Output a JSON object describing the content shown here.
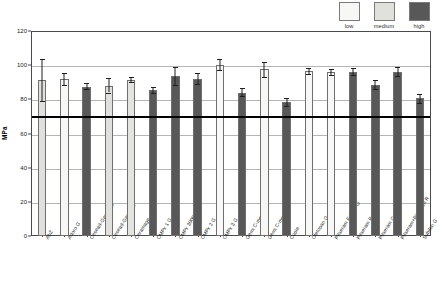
{
  "chart_data": {
    "type": "bar",
    "title": "",
    "xlabel": "",
    "ylabel": "MPa",
    "ylim": [
      0,
      120
    ],
    "ytick_values": [
      0,
      20,
      40,
      60,
      80,
      100,
      120
    ],
    "ytick_labels": [
      "0",
      "20",
      "40",
      "60",
      "80",
      "100",
      "120"
    ],
    "grid": true,
    "legend_position": "top-right",
    "reference_line": {
      "value": 70,
      "label": "",
      "style": "solid-bold"
    },
    "legend": [
      {
        "name": "low",
        "color": "#f7f7f5"
      },
      {
        "name": "medium",
        "color": "#e0e0dd"
      },
      {
        "name": "high",
        "color": "#585858"
      }
    ],
    "categories": [
      "AbZ",
      "Adoro G",
      "Cesead-Gama HV",
      "Cesead-Gama LV",
      "Ceramage",
      "CMPx 1 G",
      "CMPx 3000 G",
      "CMPx 2 G",
      "CMPx 3 G",
      "Gemi C-mente 1",
      "Gemi C-mente 3",
      "Cupie",
      "Oletopan G",
      "Pitseram E Flow G",
      "Pitseram R G",
      "Pitseram G",
      "Pitseram+Pitseram R",
      "Subilon G"
    ],
    "values": [
      91.5,
      92.0,
      87.5,
      88.0,
      91.5,
      85.5,
      93.5,
      92.0,
      100.0,
      84.0,
      97.5,
      78.5,
      96.5,
      96.0,
      96.0,
      88.5,
      96.0,
      80.5
    ],
    "errors_upper": [
      12.0,
      3.5,
      2.0,
      4.5,
      1.5,
      2.0,
      5.5,
      3.5,
      3.5,
      2.5,
      4.5,
      2.5,
      2.0,
      2.0,
      2.5,
      3.0,
      3.0,
      2.5
    ],
    "errors_lower": [
      12.5,
      3.5,
      1.5,
      4.0,
      1.5,
      2.0,
      5.0,
      3.0,
      3.0,
      2.0,
      4.5,
      2.5,
      1.5,
      1.5,
      2.0,
      2.5,
      2.5,
      2.5
    ],
    "series_group": [
      "medium",
      "low",
      "high",
      "medium",
      "medium",
      "high",
      "high",
      "high",
      "low",
      "high",
      "low",
      "high",
      "low",
      "low",
      "high",
      "high",
      "high",
      "high"
    ],
    "bar_colors": [
      "#e0e0dd",
      "#f7f7f5",
      "#585858",
      "#e0e0dd",
      "#e3e3e0",
      "#585858",
      "#585858",
      "#585858",
      "#f9f9f7",
      "#585858",
      "#f7f7f5",
      "#585858",
      "#f7f7f5",
      "#f7f7f5",
      "#585858",
      "#585858",
      "#585858",
      "#585858"
    ]
  },
  "axes": {
    "y_title": "MPa"
  }
}
